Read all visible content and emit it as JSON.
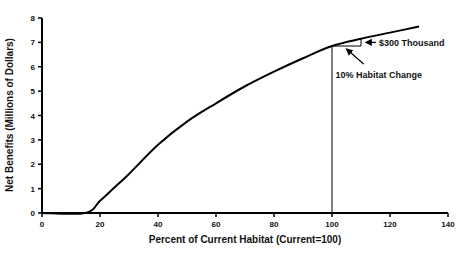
{
  "chart_data": {
    "type": "line",
    "title": "",
    "xlabel": "Percent of Current Habitat (Current=100)",
    "ylabel": "Net Benefits (Millions of Dollars)",
    "xlim": [
      0,
      140
    ],
    "ylim": [
      0,
      8
    ],
    "x_ticks": [
      0,
      20,
      40,
      60,
      80,
      100,
      120,
      140
    ],
    "y_ticks": [
      0,
      1,
      2,
      3,
      4,
      5,
      6,
      7,
      8
    ],
    "grid": false,
    "legend": null,
    "series": [
      {
        "name": "Net Benefits",
        "x": [
          0,
          15,
          20,
          25,
          30,
          40,
          50,
          60,
          70,
          80,
          90,
          100,
          110,
          120,
          130
        ],
        "y": [
          0,
          0,
          0.5,
          1.05,
          1.6,
          2.8,
          3.75,
          4.5,
          5.2,
          5.8,
          6.35,
          6.85,
          7.15,
          7.4,
          7.65
        ]
      }
    ],
    "annotations": [
      {
        "text": "$300 Thousand",
        "target": [
          110,
          7.0
        ]
      },
      {
        "text": "10% Habitat Change",
        "target": [
          104,
          6.85
        ]
      }
    ],
    "reference_lines": [
      {
        "type": "vertical",
        "x": 100,
        "from_y": 0,
        "to_y": 6.85
      },
      {
        "type": "horizontal",
        "y": 6.85,
        "from_x": 100,
        "to_x": 110
      },
      {
        "type": "vertical",
        "x": 110,
        "from_y": 6.85,
        "to_y": 7.15
      }
    ]
  },
  "labels": {
    "annotation_dollars": "$300 Thousand",
    "annotation_habitat": "10% Habitat Change"
  }
}
